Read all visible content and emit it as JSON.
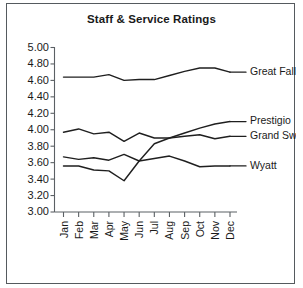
{
  "chart_data": {
    "type": "line",
    "title": "Staff & Service Ratings",
    "xlabel": "",
    "ylabel": "",
    "categories": [
      "Jan",
      "Feb",
      "Mar",
      "Apr",
      "May",
      "Jun",
      "Jul",
      "Aug",
      "Sep",
      "Oct",
      "Nov",
      "Dec"
    ],
    "ylim": [
      3.0,
      5.0
    ],
    "ytick_labels": [
      "5.00",
      "4.80",
      "4.60",
      "4.40",
      "4.20",
      "4.00",
      "3.80",
      "3.60",
      "3.40",
      "3.20",
      "3.00"
    ],
    "ytick_values": [
      5.0,
      4.8,
      4.6,
      4.4,
      4.2,
      4.0,
      3.8,
      3.6,
      3.4,
      3.2,
      3.0
    ],
    "grid": false,
    "legend_position": "right-inline-labels",
    "series": [
      {
        "name": "Great Falls",
        "values": [
          4.64,
          4.64,
          4.64,
          4.67,
          4.6,
          4.61,
          4.61,
          4.66,
          4.71,
          4.75,
          4.75,
          4.7
        ],
        "label_value": 4.7
      },
      {
        "name": "Prestigio",
        "values": [
          3.56,
          3.56,
          3.51,
          3.5,
          3.38,
          3.62,
          3.83,
          3.9,
          3.96,
          4.02,
          4.07,
          4.1
        ],
        "label_value": 4.1
      },
      {
        "name": "Grand Swan",
        "values": [
          3.97,
          4.01,
          3.95,
          3.97,
          3.86,
          3.96,
          3.9,
          3.9,
          3.92,
          3.94,
          3.89,
          3.92
        ],
        "label_value": 3.92
      },
      {
        "name": "Wyatt",
        "values": [
          3.67,
          3.64,
          3.66,
          3.63,
          3.7,
          3.62,
          3.65,
          3.68,
          3.62,
          3.55,
          3.56,
          3.56
        ],
        "label_value": 3.56
      }
    ],
    "colors": {
      "line": "#1f1f1f",
      "axis": "#5b6064",
      "text": "#1a1a1a",
      "background": "#ffffff",
      "frame": "#555a5e"
    }
  }
}
